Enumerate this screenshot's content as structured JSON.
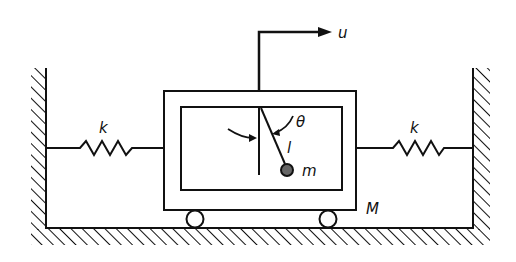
{
  "diagram": {
    "type": "mechanical-schematic",
    "colors": {
      "ink": "#111111",
      "background": "#ffffff",
      "bob_fill": "#555555"
    },
    "labels": {
      "input_force": "u",
      "spring_left": "k",
      "spring_right": "k",
      "angle": "θ",
      "pendulum_length": "l",
      "bob_mass": "m",
      "cart_mass": "M"
    },
    "components": [
      {
        "id": "left-wall",
        "kind": "fixed-wall"
      },
      {
        "id": "right-wall",
        "kind": "fixed-wall"
      },
      {
        "id": "floor",
        "kind": "ground"
      },
      {
        "id": "left-spring",
        "kind": "spring",
        "label": "k"
      },
      {
        "id": "right-spring",
        "kind": "spring",
        "label": "k"
      },
      {
        "id": "cart",
        "kind": "mass",
        "label": "M"
      },
      {
        "id": "pendulum",
        "kind": "pendulum",
        "length_label": "l",
        "mass_label": "m",
        "angle_label": "θ"
      },
      {
        "id": "force-input",
        "kind": "arrow",
        "label": "u"
      },
      {
        "id": "wheels",
        "kind": "rollers",
        "count": 2
      }
    ]
  }
}
